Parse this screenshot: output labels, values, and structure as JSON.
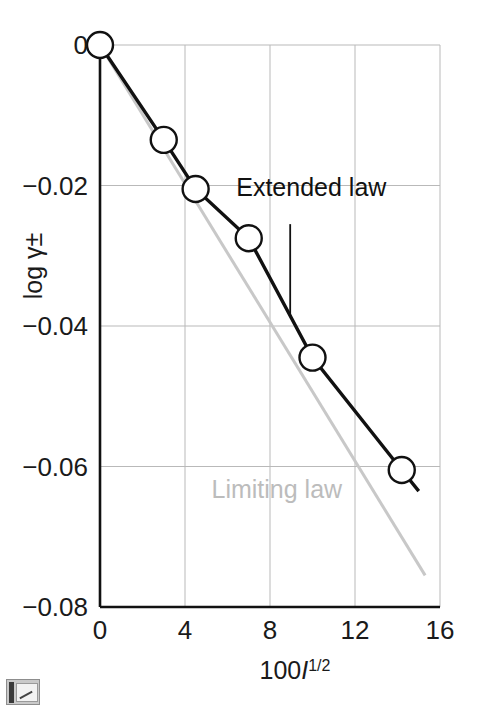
{
  "chart_data": {
    "type": "line",
    "title": "",
    "xlabel": "100I^1/2",
    "xlabel_parts": {
      "prefix": "100",
      "italic": "I",
      "superscript": "1/2"
    },
    "ylabel": "log γ±",
    "xlim": [
      0,
      16
    ],
    "ylim": [
      -0.08,
      0
    ],
    "xticks": [
      0,
      4,
      8,
      12,
      16
    ],
    "yticks": [
      0,
      -0.02,
      -0.04,
      -0.06,
      -0.08
    ],
    "xtick_labels": [
      "0",
      "4",
      "8",
      "12",
      "16"
    ],
    "ytick_labels": [
      "0",
      "−0.02",
      "−0.04",
      "−0.06",
      "−0.08"
    ],
    "grid": true,
    "legend_position": "inline-annotations",
    "series": [
      {
        "name": "Extended law",
        "color": "#111111",
        "marker": "open-circle",
        "x": [
          0,
          3.0,
          4.5,
          7.0,
          10.0,
          14.2,
          15.0
        ],
        "y": [
          0,
          -0.0135,
          -0.0205,
          -0.0275,
          -0.0445,
          -0.0605,
          -0.0635
        ]
      },
      {
        "name": "Limiting law",
        "color": "#c8c8c8",
        "marker": "none",
        "x": [
          0,
          15.3
        ],
        "y": [
          0,
          -0.0755
        ]
      }
    ],
    "annotations": [
      {
        "name": "extended-law-annotation",
        "text": "Extended law",
        "color": "#111111",
        "text_x": 9.0,
        "text_y": -0.0215,
        "leader_from": [
          8.95,
          -0.0255
        ],
        "leader_to": [
          8.95,
          -0.0385
        ]
      },
      {
        "name": "limiting-law-annotation",
        "text": "Limiting law",
        "color": "#bcbcbc",
        "text_x": 7.6,
        "text_y": -0.0645
      }
    ]
  },
  "icons": {
    "corner_badge": "image-placeholder-icon"
  }
}
